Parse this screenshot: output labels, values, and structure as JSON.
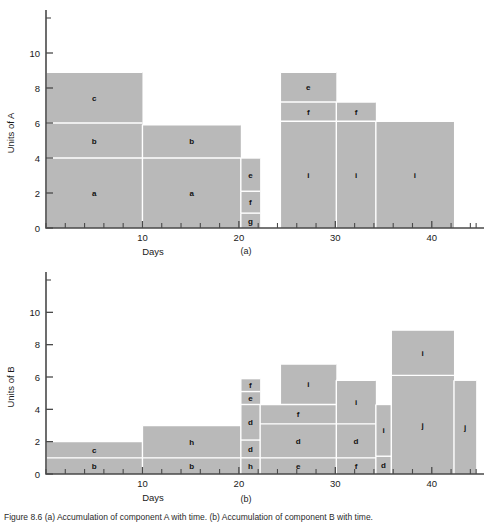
{
  "figure": {
    "caption": "Figure 8.6  (a) Accumulation of component A with time. (b) Accumulation of component B with time.",
    "subcaption_a": "(a)",
    "subcaption_b": "(b)"
  },
  "chart_data": [
    {
      "id": "chart-a",
      "type": "bar",
      "title": "",
      "xlabel": "Days",
      "ylabel": "Units of A",
      "xlim": [
        0,
        45
      ],
      "ylim": [
        0,
        12
      ],
      "xticks": [
        0,
        2,
        4,
        6,
        8,
        10,
        12,
        14,
        16,
        18,
        20,
        22,
        24,
        26,
        28,
        30,
        32,
        34,
        36,
        38,
        40,
        42,
        44
      ],
      "xticklabels": {
        "10": "10",
        "20": "20",
        "30": "30",
        "40": "40"
      },
      "yticks": [
        0,
        2,
        4,
        6,
        8,
        10,
        12
      ],
      "yticklabels": {
        "0": "0",
        "2": "2",
        "4": "4",
        "6": "6",
        "8": "8",
        "10": "10"
      },
      "grid": false,
      "legend": "none",
      "blocks": [
        {
          "label": "a",
          "x0": 0,
          "x1": 10,
          "y0": 0,
          "y1": 4
        },
        {
          "label": "b",
          "x0": 0,
          "x1": 10,
          "y0": 4,
          "y1": 6
        },
        {
          "label": "c",
          "x0": 0,
          "x1": 10,
          "y0": 6,
          "y1": 8.9
        },
        {
          "label": "a",
          "x0": 10,
          "x1": 20.2,
          "y0": 0,
          "y1": 4
        },
        {
          "label": "b",
          "x0": 10,
          "x1": 20.2,
          "y0": 4,
          "y1": 5.9
        },
        {
          "label": "g",
          "x0": 20.2,
          "x1": 22.2,
          "y0": 0,
          "y1": 0.85
        },
        {
          "label": "f",
          "x0": 20.2,
          "x1": 22.2,
          "y0": 0.85,
          "y1": 2.1
        },
        {
          "label": "e",
          "x0": 20.2,
          "x1": 22.2,
          "y0": 2.1,
          "y1": 4
        },
        {
          "label": "i",
          "x0": 24.3,
          "x1": 30.1,
          "y0": 0,
          "y1": 6.1
        },
        {
          "label": "f",
          "x0": 24.3,
          "x1": 30.1,
          "y0": 6.1,
          "y1": 7.2
        },
        {
          "label": "e",
          "x0": 24.3,
          "x1": 30.1,
          "y0": 7.2,
          "y1": 8.9
        },
        {
          "label": "i",
          "x0": 30.1,
          "x1": 34.2,
          "y0": 0,
          "y1": 6.1
        },
        {
          "label": "f",
          "x0": 30.1,
          "x1": 34.2,
          "y0": 6.1,
          "y1": 7.2
        },
        {
          "label": "i",
          "x0": 34.2,
          "x1": 42.3,
          "y0": 0,
          "y1": 6.1
        }
      ]
    },
    {
      "id": "chart-b",
      "type": "bar",
      "title": "",
      "xlabel": "Days",
      "ylabel": "Units of B",
      "xlim": [
        0,
        45
      ],
      "ylim": [
        0,
        12
      ],
      "xticks": [
        0,
        2,
        4,
        6,
        8,
        10,
        12,
        14,
        16,
        18,
        20,
        22,
        24,
        26,
        28,
        30,
        32,
        34,
        36,
        38,
        40,
        42,
        44
      ],
      "xticklabels": {
        "10": "10",
        "20": "20",
        "30": "30",
        "40": "40"
      },
      "yticks": [
        0,
        2,
        4,
        6,
        8,
        10,
        12
      ],
      "yticklabels": {
        "0": "0",
        "2": "2",
        "4": "4",
        "6": "6",
        "8": "8",
        "10": "10"
      },
      "grid": false,
      "legend": "none",
      "blocks": [
        {
          "label": "b",
          "x0": 0,
          "x1": 10,
          "y0": 0,
          "y1": 1
        },
        {
          "label": "c",
          "x0": 0,
          "x1": 10,
          "y0": 1,
          "y1": 2
        },
        {
          "label": "b",
          "x0": 10,
          "x1": 20.2,
          "y0": 0,
          "y1": 1
        },
        {
          "label": "h",
          "x0": 10,
          "x1": 20.2,
          "y0": 1,
          "y1": 3
        },
        {
          "label": "h",
          "x0": 20.2,
          "x1": 22.2,
          "y0": 0,
          "y1": 1
        },
        {
          "label": "d",
          "x0": 20.2,
          "x1": 22.2,
          "y0": 1,
          "y1": 2.1
        },
        {
          "label": "d",
          "x0": 20.2,
          "x1": 22.2,
          "y0": 2.1,
          "y1": 4.3
        },
        {
          "label": "e",
          "x0": 20.2,
          "x1": 22.2,
          "y0": 4.3,
          "y1": 5.1
        },
        {
          "label": "f",
          "x0": 20.2,
          "x1": 22.2,
          "y0": 5.1,
          "y1": 5.9
        },
        {
          "label": "e",
          "x0": 22.2,
          "x1": 30.1,
          "y0": 0,
          "y1": 1
        },
        {
          "label": "d",
          "x0": 22.2,
          "x1": 30.1,
          "y0": 1,
          "y1": 3.1
        },
        {
          "label": "f",
          "x0": 22.2,
          "x1": 30.1,
          "y0": 3.1,
          "y1": 4.3
        },
        {
          "label": "i",
          "x0": 24.3,
          "x1": 30.1,
          "y0": 4.3,
          "y1": 6.8
        },
        {
          "label": "f",
          "x0": 30.1,
          "x1": 34.2,
          "y0": 0,
          "y1": 1
        },
        {
          "label": "d",
          "x0": 30.1,
          "x1": 34.2,
          "y0": 1,
          "y1": 3.1
        },
        {
          "label": "i",
          "x0": 30.1,
          "x1": 34.2,
          "y0": 3.1,
          "y1": 5.8
        },
        {
          "label": "d",
          "x0": 34.2,
          "x1": 35.8,
          "y0": 0,
          "y1": 1.1
        },
        {
          "label": "i",
          "x0": 34.2,
          "x1": 35.8,
          "y0": 1.1,
          "y1": 4.3
        },
        {
          "label": "j",
          "x0": 35.8,
          "x1": 42.3,
          "y0": 0,
          "y1": 6.1
        },
        {
          "label": "i",
          "x0": 35.8,
          "x1": 42.3,
          "y0": 6.1,
          "y1": 8.9
        },
        {
          "label": "j",
          "x0": 42.3,
          "x1": 44.6,
          "y0": 0,
          "y1": 5.8
        }
      ]
    }
  ]
}
